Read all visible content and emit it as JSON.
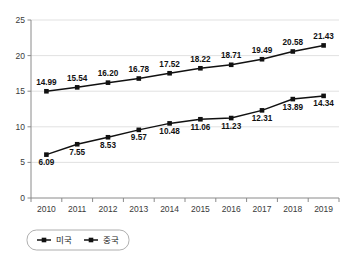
{
  "chart_data": {
    "type": "line",
    "title": "",
    "xlabel": "",
    "ylabel": "",
    "categories": [
      "2010",
      "2011",
      "2012",
      "2013",
      "2014",
      "2015",
      "2016",
      "2017",
      "2018",
      "2019"
    ],
    "series": [
      {
        "name": "미국",
        "values": [
          14.99,
          15.54,
          16.2,
          16.78,
          17.52,
          18.22,
          18.71,
          19.49,
          20.58,
          21.43
        ],
        "labels": [
          "14.99",
          "15.54",
          "16.20",
          "16.78",
          "17.52",
          "18.22",
          "18.71",
          "19.49",
          "20.58",
          "21.43"
        ],
        "color": "#111111",
        "marker": "square",
        "label_position": "above"
      },
      {
        "name": "중국",
        "values": [
          6.09,
          7.55,
          8.53,
          9.57,
          10.48,
          11.06,
          11.23,
          12.31,
          13.89,
          14.34
        ],
        "labels": [
          "6.09",
          "7.55",
          "8.53",
          "9.57",
          "10.48",
          "11.06",
          "11.23",
          "12.31",
          "13.89",
          "14.34"
        ],
        "color": "#111111",
        "marker": "square",
        "label_position": "below"
      }
    ],
    "yticks": [
      "0",
      "5",
      "10",
      "15",
      "20",
      "25"
    ],
    "ytick_values": [
      0,
      5,
      10,
      15,
      20,
      25
    ],
    "ylim": [
      0,
      25
    ],
    "grid": true,
    "grid_axis": "y",
    "legend": {
      "position": "bottom-left",
      "entries": [
        {
          "label": "미국",
          "color": "#111111"
        },
        {
          "label": "중국",
          "color": "#111111"
        }
      ]
    },
    "colors": {
      "grid": "#d9d9d9",
      "axis": "#8a8a8a",
      "series": "#111111",
      "background": "#ffffff"
    }
  }
}
